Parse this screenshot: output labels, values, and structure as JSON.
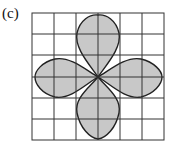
{
  "figure": {
    "label": "(c)",
    "grid": {
      "rows": 6,
      "cols": 6,
      "line_color": "#333333"
    },
    "shape": {
      "name": "four-petal rose",
      "fill": "#c8c8c8",
      "stroke": "#222222"
    }
  }
}
